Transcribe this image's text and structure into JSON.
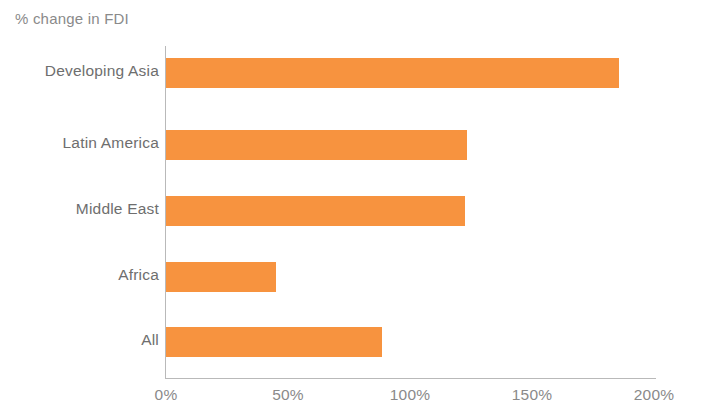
{
  "chart_data": {
    "type": "bar",
    "orientation": "horizontal",
    "title": "% change in FDI",
    "xlabel": "",
    "ylabel": "",
    "categories": [
      "Developing Asia",
      "Latin America",
      "Middle East",
      "Africa",
      "All"
    ],
    "values": [
      185,
      123,
      122,
      45,
      88
    ],
    "xlim": [
      0,
      200
    ],
    "xticks": [
      0,
      50,
      100,
      150,
      200
    ],
    "xtick_labels": [
      "0%",
      "50%",
      "100%",
      "150%",
      "200%"
    ],
    "grid": false,
    "legend": null,
    "series": [
      {
        "name": "% change in FDI",
        "values": [
          185,
          123,
          122,
          45,
          88
        ],
        "color": "#f7933f"
      }
    ],
    "colors": {
      "bar": "#f7933f",
      "axis": "#b9b9b9",
      "label_text": "#6e6e6e",
      "title_text": "#8a8a8a",
      "background": "#ffffff"
    }
  }
}
